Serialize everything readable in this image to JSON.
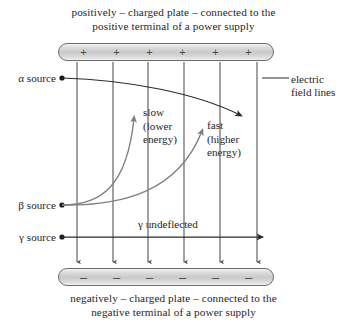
{
  "diagram": {
    "title_top": {
      "line1": "positively – charged plate – connected to the",
      "line2": "positive terminal of a power supply"
    },
    "title_bottom": {
      "line1": "negatively – charged plate – connected to the",
      "line2": "negative terminal of a power supply"
    },
    "plates": {
      "top": {
        "sign": "+",
        "count": 6,
        "polarity": "positive"
      },
      "bottom": {
        "sign": "–",
        "count": 6,
        "polarity": "negative"
      }
    },
    "sources": {
      "alpha": "α source",
      "beta": "β source",
      "gamma": "γ source"
    },
    "annotations": {
      "electric_field_lines": {
        "line1": "electric",
        "line2": "field lines"
      },
      "slow": {
        "line1": "slow",
        "line2": "(lower",
        "line3": "energy)"
      },
      "fast": {
        "line1": "fast",
        "line2": "(higher",
        "line3": "energy)"
      },
      "gamma_undeflected": "γ undeflected"
    },
    "colors": {
      "ink": "#1f1f1f",
      "ray_black": "#2b2b2b",
      "ray_gray": "#808080",
      "field_line": "#555555",
      "plate_border": "#6e6e6e",
      "plate_fill": "#d5d5d5"
    },
    "field_lines": {
      "count": 6,
      "x_positions": [
        77,
        113,
        148,
        184,
        220,
        257
      ],
      "direction": "downward"
    }
  }
}
